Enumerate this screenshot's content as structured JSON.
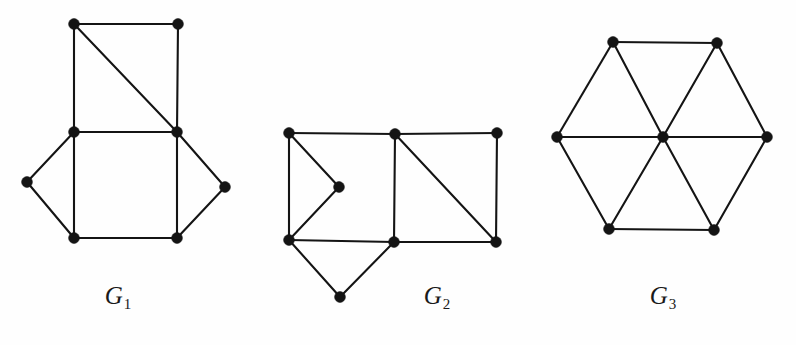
{
  "figure": {
    "kind": "graph-diagram",
    "caption_font_style": "italic-serif",
    "background_color": "#fefefe",
    "ink_color": "#141414",
    "vertex_radius": 5.4,
    "edge_width": 2.1,
    "width": 796,
    "height": 345
  },
  "graphs": [
    {
      "id": "G1",
      "label_text": "G",
      "label_subscript": "1",
      "label_x": 118,
      "label_y": 297,
      "vertex_count": 8,
      "edge_count": 11,
      "vertices": [
        {
          "name": "g1-v-top-left",
          "x": 74,
          "y": 24
        },
        {
          "name": "g1-v-top-right",
          "x": 178,
          "y": 24
        },
        {
          "name": "g1-v-mid-left",
          "x": 74,
          "y": 132
        },
        {
          "name": "g1-v-mid-right",
          "x": 177,
          "y": 132
        },
        {
          "name": "g1-v-far-left",
          "x": 27,
          "y": 182
        },
        {
          "name": "g1-v-far-right",
          "x": 225,
          "y": 187
        },
        {
          "name": "g1-v-bottom-left",
          "x": 74,
          "y": 238
        },
        {
          "name": "g1-v-bottom-right",
          "x": 177,
          "y": 238
        }
      ],
      "edges": [
        [
          0,
          1
        ],
        [
          0,
          2
        ],
        [
          0,
          3
        ],
        [
          1,
          3
        ],
        [
          2,
          3
        ],
        [
          2,
          4
        ],
        [
          2,
          6
        ],
        [
          4,
          6
        ],
        [
          3,
          5
        ],
        [
          3,
          7
        ],
        [
          5,
          7
        ],
        [
          6,
          7
        ]
      ]
    },
    {
      "id": "G2",
      "label_text": "G",
      "label_subscript": "2",
      "label_x": 437,
      "label_y": 297,
      "vertex_count": 8,
      "edge_count": 12,
      "vertices": [
        {
          "name": "g2-v-top-left",
          "x": 289,
          "y": 133
        },
        {
          "name": "g2-v-top-mid",
          "x": 395,
          "y": 134
        },
        {
          "name": "g2-v-top-right",
          "x": 497,
          "y": 133
        },
        {
          "name": "g2-v-inner",
          "x": 339,
          "y": 187
        },
        {
          "name": "g2-v-bottom-left",
          "x": 289,
          "y": 240
        },
        {
          "name": "g2-v-bottom-mid",
          "x": 394,
          "y": 242
        },
        {
          "name": "g2-v-bottom-right",
          "x": 496,
          "y": 242
        },
        {
          "name": "g2-v-pendant-below",
          "x": 340,
          "y": 297
        }
      ],
      "edges": [
        [
          0,
          1
        ],
        [
          1,
          2
        ],
        [
          0,
          3
        ],
        [
          3,
          4
        ],
        [
          0,
          4
        ],
        [
          1,
          5
        ],
        [
          1,
          6
        ],
        [
          2,
          6
        ],
        [
          4,
          5
        ],
        [
          5,
          6
        ],
        [
          4,
          7
        ],
        [
          5,
          7
        ]
      ]
    },
    {
      "id": "G3",
      "label_text": "G",
      "label_subscript": "3",
      "label_x": 663,
      "label_y": 297,
      "vertex_count": 7,
      "edge_count": 12,
      "vertices": [
        {
          "name": "g3-v-top-left",
          "x": 613,
          "y": 42
        },
        {
          "name": "g3-v-top-right",
          "x": 717,
          "y": 43
        },
        {
          "name": "g3-v-left",
          "x": 557,
          "y": 137
        },
        {
          "name": "g3-v-center",
          "x": 663,
          "y": 137
        },
        {
          "name": "g3-v-right",
          "x": 767,
          "y": 137
        },
        {
          "name": "g3-v-bottom-left",
          "x": 609,
          "y": 229
        },
        {
          "name": "g3-v-bottom-right",
          "x": 714,
          "y": 230
        }
      ],
      "edges": [
        [
          0,
          1
        ],
        [
          0,
          2
        ],
        [
          0,
          3
        ],
        [
          1,
          3
        ],
        [
          1,
          4
        ],
        [
          2,
          3
        ],
        [
          3,
          4
        ],
        [
          2,
          5
        ],
        [
          3,
          5
        ],
        [
          3,
          6
        ],
        [
          4,
          6
        ],
        [
          5,
          6
        ]
      ]
    }
  ]
}
